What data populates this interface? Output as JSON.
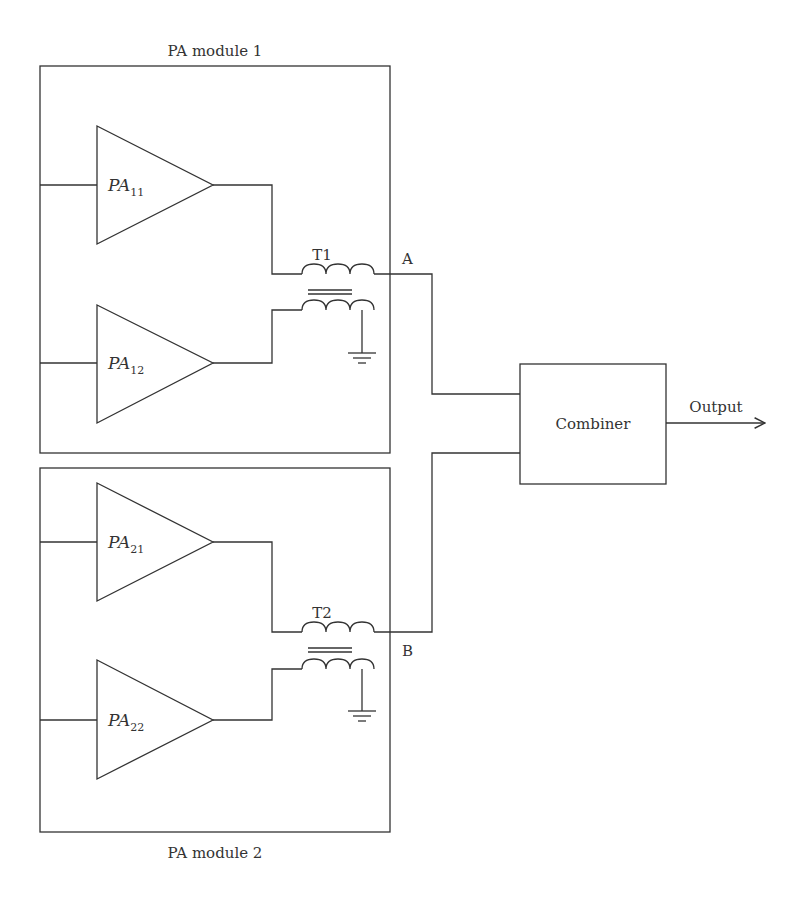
{
  "diagram": {
    "modules": [
      {
        "title": "PA module 1",
        "amplifiers": [
          {
            "name": "PA",
            "sub": "11"
          },
          {
            "name": "PA",
            "sub": "12"
          }
        ],
        "transformer": "T1",
        "node": "A"
      },
      {
        "title": "PA module 2",
        "amplifiers": [
          {
            "name": "PA",
            "sub": "21"
          },
          {
            "name": "PA",
            "sub": "22"
          }
        ],
        "transformer": "T2",
        "node": "B"
      }
    ],
    "combiner": "Combiner",
    "output": "Output",
    "colors": {
      "line": "#333333",
      "background": "#ffffff"
    }
  }
}
